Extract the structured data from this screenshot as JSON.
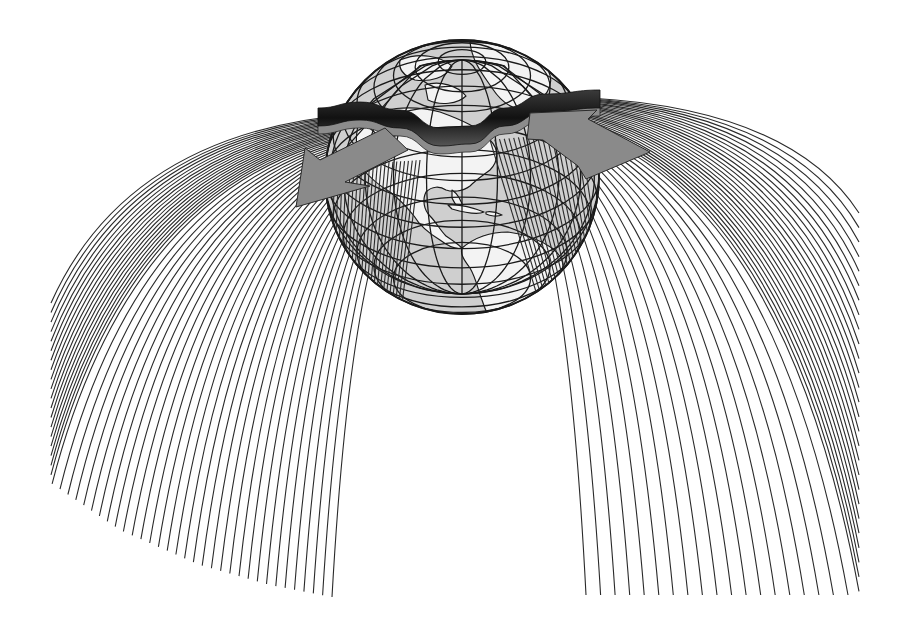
{
  "figure": {
    "canvas": {
      "width": 903,
      "height": 626,
      "background": "#ffffff"
    }
  },
  "globe": {
    "center": [
      462,
      177
    ],
    "radius": 137,
    "ocean_color": "#cfcfcf",
    "land_color": "#f3f3f3",
    "outline_color": "#1a1a1a",
    "pole": [
      460,
      62
    ],
    "visible_regions": [
      "North America",
      "Central America",
      "Caribbean",
      "South America",
      "Greenland",
      "Arctic"
    ]
  },
  "ribbon": {
    "label": "jet-stream",
    "top_color": "#1c1c1c",
    "under_color": "#8c8c8c",
    "path_points": [
      [
        318,
        118
      ],
      [
        360,
        112
      ],
      [
        400,
        120
      ],
      [
        440,
        138
      ],
      [
        470,
        136
      ],
      [
        505,
        118
      ],
      [
        545,
        104
      ],
      [
        600,
        100
      ]
    ]
  },
  "arrows": [
    {
      "name": "left-flow-arrow",
      "direction": "down-left",
      "color": "#8a8a8a",
      "points": [
        [
          296,
          207
        ],
        [
          305,
          148
        ],
        [
          320,
          160
        ],
        [
          385,
          128
        ],
        [
          408,
          150
        ],
        [
          345,
          182
        ],
        [
          370,
          186
        ]
      ]
    },
    {
      "name": "right-flow-arrow",
      "direction": "right",
      "color": "#8a8a8a",
      "points": [
        [
          530,
          113
        ],
        [
          597,
          110
        ],
        [
          588,
          119
        ],
        [
          650,
          152
        ],
        [
          586,
          179
        ],
        [
          578,
          166
        ],
        [
          543,
          140
        ],
        [
          527,
          139
        ]
      ]
    }
  ],
  "curtains": [
    {
      "name": "left-curtain",
      "line_count": 52,
      "line_color": "#2a2a2a",
      "top_edge": {
        "from": [
          355,
          114
        ],
        "to": [
          420,
          160
        ]
      },
      "bottom_edge": [
        [
          51,
          303
        ],
        [
          51,
          483
        ],
        [
          120,
          530
        ],
        [
          200,
          565
        ],
        [
          270,
          585
        ],
        [
          332,
          597
        ]
      ]
    },
    {
      "name": "right-curtain",
      "line_count": 46,
      "line_color": "#2a2a2a",
      "top_edge": {
        "from": [
          500,
          130
        ],
        "to": [
          590,
          98
        ]
      },
      "bottom_edge": [
        [
          586,
          595
        ],
        [
          700,
          595
        ],
        [
          859,
          595
        ],
        [
          859,
          400
        ],
        [
          859,
          213
        ]
      ]
    }
  ]
}
